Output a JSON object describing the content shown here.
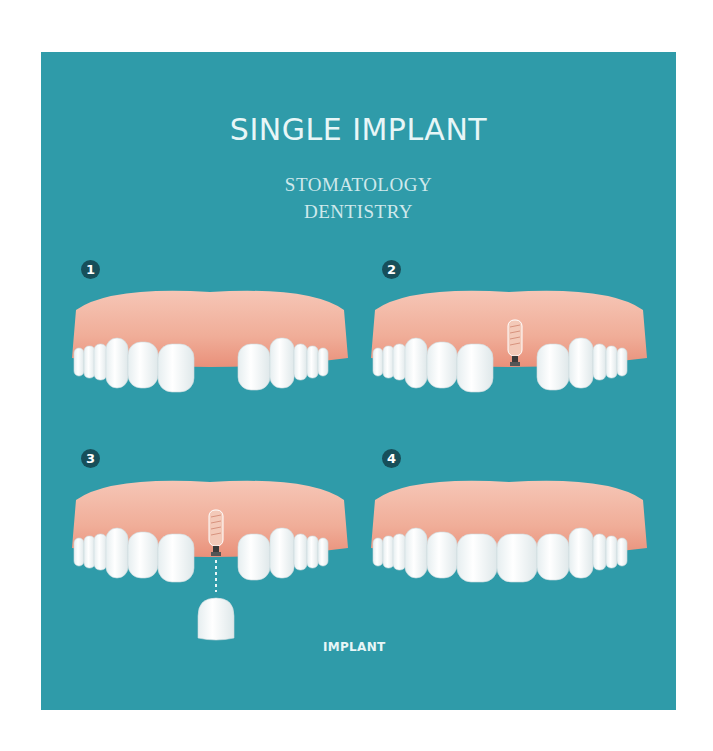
{
  "title": "SINGLE IMPLANT",
  "subtitle": {
    "line1": "STOMATOLOGY",
    "line2": "DENTISTRY"
  },
  "steps": [
    {
      "number": "1",
      "description": "missing tooth gap"
    },
    {
      "number": "2",
      "description": "implant placed in gum"
    },
    {
      "number": "3",
      "description": "crown attached to implant"
    },
    {
      "number": "4",
      "description": "complete restored teeth"
    }
  ],
  "caption": "IMPLANT",
  "colors": {
    "background": "#2f9ba9",
    "badge": "#174f5a",
    "gum": "#f2b3a0",
    "tooth": "#ffffff",
    "text": "#e8f6f7"
  }
}
